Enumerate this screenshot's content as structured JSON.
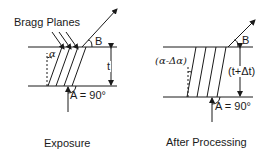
{
  "left_panel": {
    "caption": "Exposure",
    "label_bragg_planes": "Bragg Planes",
    "label_alpha": "α",
    "label_B": "B",
    "label_t": "t",
    "label_A": "A = 90°"
  },
  "right_panel": {
    "caption": "After Processing",
    "label_alpha": "(α-Δα)",
    "label_B": "B",
    "label_t": "(t+Δt)",
    "label_A": "A = 90°"
  },
  "colors": {
    "line": "#1a1a1a",
    "background": "#ffffff"
  }
}
